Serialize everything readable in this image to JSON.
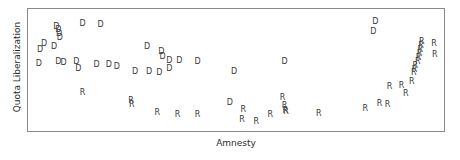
{
  "chart_data": {
    "type": "scatter",
    "title": "",
    "xlabel": "Amnesty",
    "ylabel": "Quota Liberalization",
    "grid": false,
    "legend": null,
    "axis_ticks": {
      "x": [],
      "y": []
    },
    "xlim": [
      0,
      100
    ],
    "ylim": [
      0,
      100
    ],
    "marker_style": "text-glyph",
    "series": [
      {
        "name": "D",
        "label": "D",
        "color": "#3a3a3a",
        "points": [
          {
            "x": 5.5,
            "y": 89.5
          },
          {
            "x": 6.0,
            "y": 86.0
          },
          {
            "x": 6.2,
            "y": 82.5
          },
          {
            "x": 6.4,
            "y": 79.0
          },
          {
            "x": 12.0,
            "y": 92.0
          },
          {
            "x": 16.5,
            "y": 91.0
          },
          {
            "x": 2.5,
            "y": 74.0
          },
          {
            "x": 5.0,
            "y": 70.5
          },
          {
            "x": 1.5,
            "y": 68.0
          },
          {
            "x": 1.2,
            "y": 55.5
          },
          {
            "x": 6.0,
            "y": 57.0
          },
          {
            "x": 7.3,
            "y": 56.5
          },
          {
            "x": 10.5,
            "y": 57.5
          },
          {
            "x": 11.0,
            "y": 50.5
          },
          {
            "x": 15.5,
            "y": 55.0
          },
          {
            "x": 18.5,
            "y": 55.0
          },
          {
            "x": 20.5,
            "y": 52.5
          },
          {
            "x": 28.0,
            "y": 71.0
          },
          {
            "x": 31.5,
            "y": 66.5
          },
          {
            "x": 31.8,
            "y": 62.0
          },
          {
            "x": 33.5,
            "y": 58.0
          },
          {
            "x": 36.0,
            "y": 58.0
          },
          {
            "x": 25.0,
            "y": 48.0
          },
          {
            "x": 28.5,
            "y": 48.0
          },
          {
            "x": 31.0,
            "y": 47.5
          },
          {
            "x": 33.5,
            "y": 50.5
          },
          {
            "x": 40.5,
            "y": 57.0
          },
          {
            "x": 49.5,
            "y": 48.0
          },
          {
            "x": 62.0,
            "y": 57.0
          },
          {
            "x": 84.5,
            "y": 94.0
          },
          {
            "x": 84.0,
            "y": 85.0
          },
          {
            "x": 48.5,
            "y": 20.0
          }
        ]
      },
      {
        "name": "R",
        "label": "R",
        "color": "#3a3a3a",
        "points": [
          {
            "x": 12.0,
            "y": 29.5
          },
          {
            "x": 24.0,
            "y": 21.5
          },
          {
            "x": 24.2,
            "y": 18.5
          },
          {
            "x": 30.5,
            "y": 10.5
          },
          {
            "x": 35.5,
            "y": 9.0
          },
          {
            "x": 40.5,
            "y": 9.0
          },
          {
            "x": 51.5,
            "y": 4.5
          },
          {
            "x": 51.8,
            "y": 13.5
          },
          {
            "x": 55.0,
            "y": 2.5
          },
          {
            "x": 58.5,
            "y": 9.5
          },
          {
            "x": 61.5,
            "y": 24.5
          },
          {
            "x": 62.0,
            "y": 17.5
          },
          {
            "x": 62.2,
            "y": 13.0
          },
          {
            "x": 62.4,
            "y": 12.0
          },
          {
            "x": 70.5,
            "y": 10.0
          },
          {
            "x": 82.0,
            "y": 14.5
          },
          {
            "x": 85.5,
            "y": 19.0
          },
          {
            "x": 87.5,
            "y": 18.0
          },
          {
            "x": 92.0,
            "y": 28.0
          },
          {
            "x": 88.0,
            "y": 35.0
          },
          {
            "x": 91.0,
            "y": 35.5
          },
          {
            "x": 93.5,
            "y": 39.5
          },
          {
            "x": 94.0,
            "y": 47.0
          },
          {
            "x": 94.2,
            "y": 50.0
          },
          {
            "x": 94.4,
            "y": 53.5
          },
          {
            "x": 95.0,
            "y": 57.5
          },
          {
            "x": 95.2,
            "y": 61.0
          },
          {
            "x": 95.4,
            "y": 64.5
          },
          {
            "x": 95.6,
            "y": 68.5
          },
          {
            "x": 95.8,
            "y": 72.0
          },
          {
            "x": 96.0,
            "y": 75.5
          },
          {
            "x": 99.0,
            "y": 74.0
          },
          {
            "x": 99.2,
            "y": 64.0
          }
        ]
      }
    ]
  }
}
